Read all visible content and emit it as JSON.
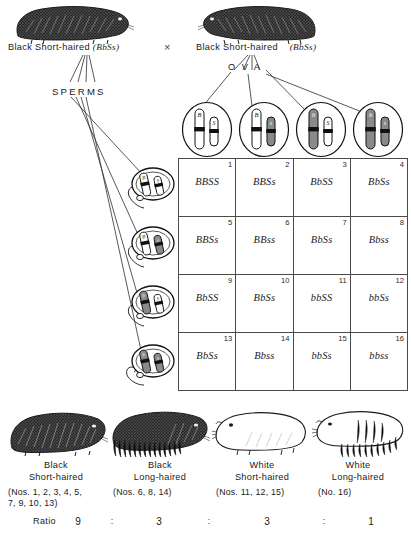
{
  "figure": {
    "type": "punnett-square-dihybrid-cross",
    "organism": "guinea pig",
    "cross_symbol": "×",
    "sperms_label": "SPERMS",
    "ova_label": "O V A"
  },
  "parents": [
    {
      "id": "parent-male",
      "label": "Black Short-haired",
      "genotype": "BbSs",
      "genotype_display": "(BbSs)"
    },
    {
      "id": "parent-female",
      "label": "Black Short-haired",
      "genotype": "BbSs",
      "genotype_display": "(BbSs)"
    }
  ],
  "ova": [
    {
      "index": 1,
      "alleles": "BS",
      "b_allele": "B",
      "s_allele": "S",
      "b_shaded": false,
      "s_shaded": false
    },
    {
      "index": 2,
      "alleles": "Bs",
      "b_allele": "B",
      "s_allele": "s",
      "b_shaded": false,
      "s_shaded": true
    },
    {
      "index": 3,
      "alleles": "bS",
      "b_allele": "b",
      "s_allele": "S",
      "b_shaded": true,
      "s_shaded": false
    },
    {
      "index": 4,
      "alleles": "bs",
      "b_allele": "b",
      "s_allele": "s",
      "b_shaded": true,
      "s_shaded": true
    }
  ],
  "sperms": [
    {
      "index": 1,
      "alleles": "BS",
      "b_allele": "B",
      "s_allele": "S",
      "b_shaded": false,
      "s_shaded": false
    },
    {
      "index": 2,
      "alleles": "Bs",
      "b_allele": "B",
      "s_allele": "s",
      "b_shaded": false,
      "s_shaded": true
    },
    {
      "index": 3,
      "alleles": "bS",
      "b_allele": "b",
      "s_allele": "S",
      "b_shaded": true,
      "s_shaded": false
    },
    {
      "index": 4,
      "alleles": "bs",
      "b_allele": "b",
      "s_allele": "s",
      "b_shaded": true,
      "s_shaded": true
    }
  ],
  "grid": {
    "rows": 4,
    "cols": 4,
    "cells": [
      {
        "num": "1",
        "genotype": "BBSS"
      },
      {
        "num": "2",
        "genotype": "BBSs"
      },
      {
        "num": "3",
        "genotype": "BbSS"
      },
      {
        "num": "4",
        "genotype": "BbSs"
      },
      {
        "num": "5",
        "genotype": "BBSs"
      },
      {
        "num": "6",
        "genotype": "BBss"
      },
      {
        "num": "7",
        "genotype": "BbSs"
      },
      {
        "num": "8",
        "genotype": "Bbss"
      },
      {
        "num": "9",
        "genotype": "BbSS"
      },
      {
        "num": "10",
        "genotype": "BbSs"
      },
      {
        "num": "11",
        "genotype": "bbSS"
      },
      {
        "num": "12",
        "genotype": "bbSs"
      },
      {
        "num": "13",
        "genotype": "BbSs"
      },
      {
        "num": "14",
        "genotype": "Bbss"
      },
      {
        "num": "15",
        "genotype": "bbSs"
      },
      {
        "num": "16",
        "genotype": "bbss"
      }
    ]
  },
  "offspring": [
    {
      "id": "black-short-haired",
      "line1": "Black",
      "line2": "Short-haired",
      "nos": "(Nos. 1, 2, 3, 4, 5,\n7, 9, 10, 13)",
      "nos_line1": "(Nos. 1, 2, 3, 4, 5,",
      "nos_line2": "7, 9, 10, 13)",
      "count": 9,
      "coat": "black",
      "hair": "short"
    },
    {
      "id": "black-long-haired",
      "line1": "Black",
      "line2": "Long-haired",
      "nos": "(Nos. 6, 8, 14)",
      "nos_line1": "(Nos. 6, 8, 14)",
      "nos_line2": "",
      "count": 3,
      "coat": "black",
      "hair": "long"
    },
    {
      "id": "white-short-haired",
      "line1": "White",
      "line2": "Short-haired",
      "nos": "(Nos. 11, 12, 15)",
      "nos_line1": "(Nos. 11, 12, 15)",
      "nos_line2": "",
      "count": 3,
      "coat": "white",
      "hair": "short"
    },
    {
      "id": "white-long-haired",
      "line1": "White",
      "line2": "Long-haired",
      "nos": "(No. 16)",
      "nos_line1": "(No. 16)",
      "nos_line2": "",
      "count": 1,
      "coat": "white",
      "hair": "long"
    }
  ],
  "ratio": {
    "label": "Ratio",
    "values": [
      "9",
      "3",
      "3",
      "1"
    ],
    "separator": ":"
  },
  "colors": {
    "ink": "#1a1a1a",
    "grid_line": "#4a4a4a",
    "background": "#ffffff",
    "chromosome_shaded": "#6b6b6b",
    "centromere": "#111111"
  }
}
